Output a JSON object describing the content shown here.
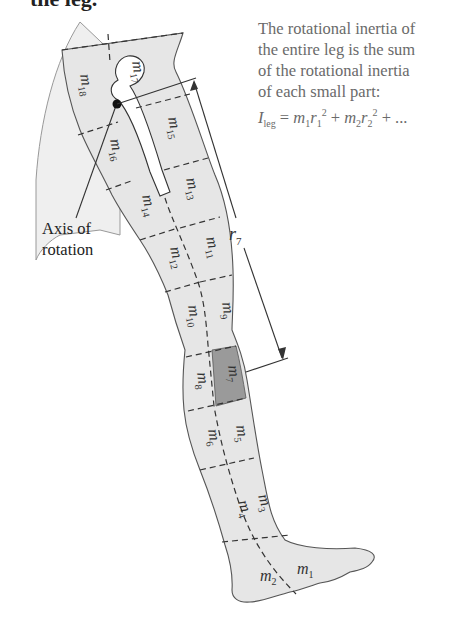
{
  "heading": {
    "text": "the leg."
  },
  "caption": {
    "lines": [
      "The rotational inertia of",
      "the entire leg is the sum",
      "of the rotational inertia",
      "of each small part:"
    ],
    "formula": {
      "lhs": "I",
      "lhs_sub": "leg",
      "eq": " = ",
      "t1_m": "m",
      "t1_msub": "1",
      "t1_r": "r",
      "t1_rsub": "1",
      "t1_exp": "2",
      "plus1": " + ",
      "t2_m": "m",
      "t2_msub": "2",
      "t2_r": "r",
      "t2_rsub": "2",
      "t2_exp": "2",
      "tail": " + ..."
    }
  },
  "axis_label": {
    "line1": "Axis of",
    "line2": "rotation"
  },
  "distance_label": {
    "symbol": "r",
    "sub": "7"
  },
  "segments": [
    {
      "id": "m1",
      "sub": "1"
    },
    {
      "id": "m2",
      "sub": "2"
    },
    {
      "id": "m3",
      "sub": "3"
    },
    {
      "id": "m4",
      "sub": "4"
    },
    {
      "id": "m5",
      "sub": "5"
    },
    {
      "id": "m6",
      "sub": "6"
    },
    {
      "id": "m7",
      "sub": "7",
      "highlighted": true
    },
    {
      "id": "m8",
      "sub": "8"
    },
    {
      "id": "m9",
      "sub": "9"
    },
    {
      "id": "m10",
      "sub": "10"
    },
    {
      "id": "m11",
      "sub": "11"
    },
    {
      "id": "m12",
      "sub": "12"
    },
    {
      "id": "m13",
      "sub": "13"
    },
    {
      "id": "m14",
      "sub": "14"
    },
    {
      "id": "m15",
      "sub": "15"
    },
    {
      "id": "m16",
      "sub": "16"
    },
    {
      "id": "m17",
      "sub": "17"
    },
    {
      "id": "m18",
      "sub": "18"
    }
  ],
  "mass_symbol": "m",
  "colors": {
    "leg_fill": "#e6e6e6",
    "body_fill": "#ececec",
    "highlight_fill": "#9a9a9a",
    "bone_fill": "#ffffff",
    "line": "#333333",
    "caption_text": "#6a6a6a"
  }
}
